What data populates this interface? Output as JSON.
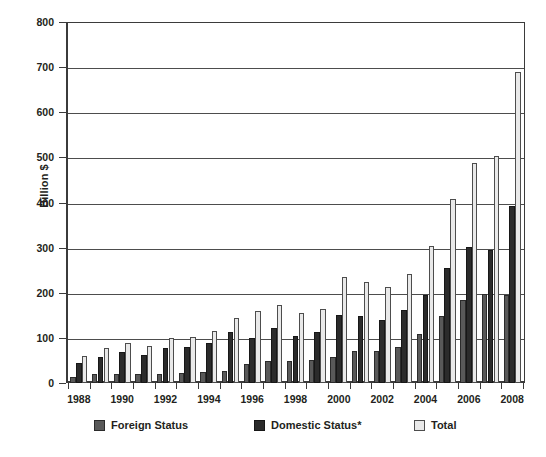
{
  "chart_data": {
    "type": "bar",
    "title": "",
    "xlabel": "",
    "ylabel": "Billion $",
    "ylim": [
      0,
      800
    ],
    "ytick_step": 100,
    "yticks": [
      0,
      100,
      200,
      300,
      400,
      500,
      600,
      700,
      800
    ],
    "grid": true,
    "legend_position": "bottom",
    "categories": [
      "1988",
      "1989",
      "1990",
      "1991",
      "1992",
      "1993",
      "1994",
      "1995",
      "1996",
      "1997",
      "1998",
      "1999",
      "2000",
      "2001",
      "2002",
      "2003",
      "2004",
      "2005",
      "2006",
      "2007",
      "2008"
    ],
    "tick_labels": [
      "1988",
      "1990",
      "1992",
      "1994",
      "1996",
      "1998",
      "2000",
      "2002",
      "2004",
      "2006",
      "2008"
    ],
    "series": [
      {
        "name": "Foreign Status",
        "color": "#595959",
        "values": [
          14,
          19,
          20,
          19,
          21,
          23,
          25,
          27,
          43,
          48,
          48,
          51,
          58,
          72,
          71,
          79,
          108,
          149,
          185,
          197,
          195
        ]
      },
      {
        "name": "Domestic Status*",
        "color": "#2b2b2b",
        "values": [
          45,
          57,
          68,
          62,
          78,
          79,
          88,
          114,
          100,
          121,
          104,
          113,
          150,
          149,
          139,
          161,
          194,
          255,
          301,
          295,
          392
        ]
      },
      {
        "name": "Total",
        "color": "#e9e9e9",
        "values": [
          60,
          77,
          89,
          81,
          100,
          103,
          115,
          143,
          160,
          173,
          155,
          165,
          235,
          223,
          212,
          242,
          304,
          408,
          488,
          503,
          690
        ]
      }
    ]
  },
  "legend": {
    "items": [
      {
        "label": "Foreign Status",
        "key": "foreign"
      },
      {
        "label": "Domestic Status*",
        "key": "domestic"
      },
      {
        "label": "Total",
        "key": "total"
      }
    ]
  },
  "axis": {
    "y_title": "Billion $"
  }
}
